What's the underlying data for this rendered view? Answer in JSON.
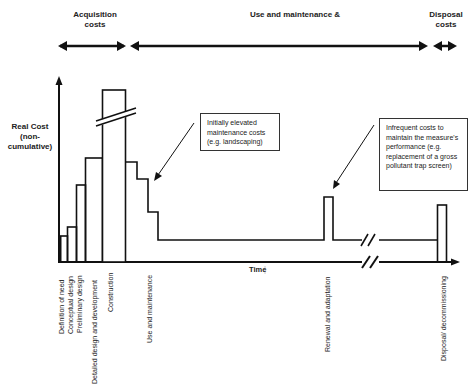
{
  "phases": {
    "acquisition": "Acquisition\ncosts",
    "acquisition_line1": "Acquisition",
    "acquisition_line2": "costs",
    "use": "Use and maintenance &",
    "disposal_line1": "Disposal",
    "disposal_line2": "costs"
  },
  "axes": {
    "y_label_line1": "Real Cost",
    "y_label_line2": "(non-",
    "y_label_line3": "cumulative)",
    "x_label": "Time"
  },
  "callouts": {
    "maintenance": "Initially elevated maintenance costs (e.g. landscaping)",
    "infrequent": "Infrequent costs to maintain the measure's performance (e.g. replacement of a gross pollutant trap screen)"
  },
  "stages": [
    {
      "label": "Definition of need"
    },
    {
      "label": "Conceptual design"
    },
    {
      "label": "Preliminary design"
    },
    {
      "label": "Detailed design and development"
    },
    {
      "label": "Construction"
    },
    {
      "label": "Use and maintenance"
    },
    {
      "label": "Renewal and adaptation"
    },
    {
      "label": "Disposal/ decommissioning"
    }
  ],
  "colors": {
    "line": "#111111",
    "background": "#ffffff"
  }
}
